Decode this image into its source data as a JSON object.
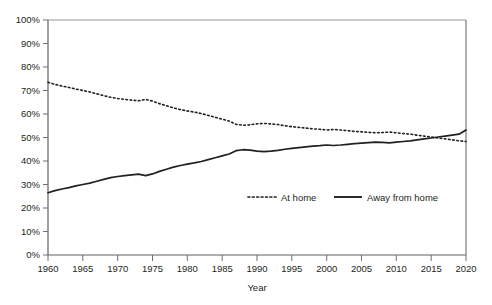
{
  "chart_data": {
    "type": "line",
    "title": "",
    "subtitle": "",
    "xlabel": "Year",
    "ylabel": "",
    "xlim": [
      1960,
      2020
    ],
    "ylim": [
      0,
      100
    ],
    "grid": false,
    "legend_position": "inside-bottom-right",
    "x_tick_labels": [
      "1960",
      "1965",
      "1970",
      "1975",
      "1980",
      "1985",
      "1990",
      "1995",
      "2000",
      "2005",
      "2010",
      "2015",
      "2020"
    ],
    "x_ticks": [
      1960,
      1965,
      1970,
      1975,
      1980,
      1985,
      1990,
      1995,
      2000,
      2005,
      2010,
      2015,
      2020
    ],
    "y_tick_labels": [
      "0%",
      "10%",
      "20%",
      "30%",
      "40%",
      "50%",
      "60%",
      "70%",
      "80%",
      "90%",
      "100%"
    ],
    "y_ticks": [
      0,
      10,
      20,
      30,
      40,
      50,
      60,
      70,
      80,
      90,
      100
    ],
    "x": [
      1960,
      1961,
      1962,
      1963,
      1964,
      1965,
      1966,
      1967,
      1968,
      1969,
      1970,
      1971,
      1972,
      1973,
      1974,
      1975,
      1976,
      1977,
      1978,
      1979,
      1980,
      1981,
      1982,
      1983,
      1984,
      1985,
      1986,
      1987,
      1988,
      1989,
      1990,
      1991,
      1992,
      1993,
      1994,
      1995,
      1996,
      1997,
      1998,
      1999,
      2000,
      2001,
      2002,
      2003,
      2004,
      2005,
      2006,
      2007,
      2008,
      2009,
      2010,
      2011,
      2012,
      2013,
      2014,
      2015,
      2016,
      2017,
      2018,
      2019,
      2020
    ],
    "series": [
      {
        "name": "At home",
        "style": "dotted",
        "color": "#231f20",
        "values": [
          73.5,
          72.6,
          71.9,
          71.3,
          70.6,
          70.0,
          69.4,
          68.6,
          67.8,
          67.1,
          66.6,
          66.2,
          65.9,
          65.6,
          66.2,
          65.5,
          64.4,
          63.5,
          62.6,
          61.9,
          61.3,
          60.8,
          60.2,
          59.4,
          58.6,
          57.8,
          57.0,
          55.6,
          55.2,
          55.4,
          55.8,
          56.0,
          55.8,
          55.5,
          55.0,
          54.6,
          54.3,
          54.0,
          53.7,
          53.5,
          53.2,
          53.4,
          53.2,
          52.9,
          52.6,
          52.4,
          52.2,
          52.0,
          52.1,
          52.3,
          52.0,
          51.7,
          51.4,
          51.0,
          50.6,
          50.2,
          49.8,
          49.4,
          49.0,
          48.6,
          48.3
        ]
      },
      {
        "name": "Away from home",
        "style": "solid",
        "color": "#231f20",
        "values": [
          26.5,
          27.4,
          28.1,
          28.7,
          29.4,
          30.0,
          30.6,
          31.4,
          32.2,
          32.9,
          33.4,
          33.8,
          34.1,
          34.4,
          33.8,
          34.5,
          35.6,
          36.5,
          37.4,
          38.1,
          38.7,
          39.2,
          39.8,
          40.6,
          41.4,
          42.2,
          43.0,
          44.4,
          44.8,
          44.6,
          44.2,
          44.0,
          44.2,
          44.5,
          45.0,
          45.4,
          45.7,
          46.0,
          46.3,
          46.5,
          46.8,
          46.6,
          46.8,
          47.1,
          47.4,
          47.6,
          47.8,
          48.0,
          47.9,
          47.7,
          48.0,
          48.3,
          48.6,
          49.0,
          49.4,
          49.8,
          50.2,
          50.6,
          51.0,
          51.4,
          53.2
        ]
      }
    ],
    "legend": [
      {
        "label": "At home",
        "style": "dotted"
      },
      {
        "label": "Away from home",
        "style": "solid"
      }
    ]
  },
  "axis": {
    "x_title": "Year"
  },
  "colors": {
    "line": "#231f20",
    "axis": "#6d6e71",
    "text": "#231f20",
    "background": "#ffffff"
  }
}
